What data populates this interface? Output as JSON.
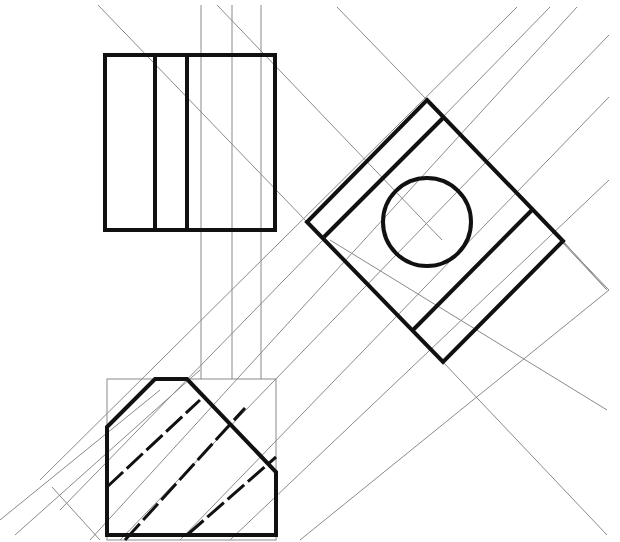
{
  "drawing": {
    "title": "Orthographic projection with auxiliary view",
    "colors": {
      "thick": "#111111",
      "thin": "#8a8a8a",
      "background": "#ffffff"
    },
    "construction_lines": [
      [
        201,
        5,
        201,
        379
      ],
      [
        232,
        5,
        232,
        379
      ],
      [
        261,
        5,
        261,
        379
      ],
      [
        98,
        5,
        307,
        222
      ],
      [
        217,
        5,
        442,
        240
      ],
      [
        337,
        7,
        427,
        100
      ],
      [
        517,
        7,
        40,
        480
      ],
      [
        550,
        7,
        60,
        510
      ],
      [
        577,
        7,
        90,
        540
      ],
      [
        609,
        35,
        120,
        540
      ],
      [
        609,
        97,
        180,
        540
      ],
      [
        609,
        180,
        230,
        540
      ],
      [
        609,
        290,
        300,
        540
      ],
      [
        427,
        100,
        609,
        290
      ],
      [
        443,
        362,
        607,
        535
      ],
      [
        532,
        210,
        607,
        290
      ],
      [
        563,
        241,
        607,
        290
      ],
      [
        330,
        240,
        607,
        410
      ],
      [
        52,
        487,
        100,
        540
      ],
      [
        15,
        535,
        200,
        370
      ],
      [
        0,
        520,
        160,
        390
      ]
    ],
    "front_view": {
      "outer": [
        105,
        55,
        275,
        230
      ],
      "inner_verticals": [
        155,
        187
      ]
    },
    "top_view": {
      "box": [
        107,
        379,
        276,
        540
      ],
      "outline": [
        [
          107,
          427
        ],
        [
          155,
          379
        ],
        [
          187,
          379
        ],
        [
          276,
          472
        ],
        [
          276,
          535
        ],
        [
          107,
          535
        ]
      ],
      "hidden_lines": [
        [
          107,
          487,
          200,
          400
        ],
        [
          125,
          540,
          245,
          408
        ],
        [
          187,
          535,
          276,
          457
        ]
      ]
    },
    "aux_view": {
      "diamond": [
        [
          427,
          100
        ],
        [
          563,
          241
        ],
        [
          443,
          362
        ],
        [
          307,
          222
        ]
      ],
      "inner_lines": [
        [
          444,
          117,
          324,
          237
        ],
        [
          532,
          210,
          413,
          330
        ]
      ],
      "circle": {
        "cx": 427,
        "cy": 222,
        "r": 44
      }
    }
  }
}
